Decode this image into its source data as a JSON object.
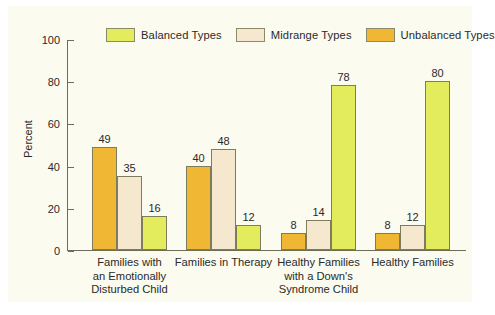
{
  "chart_data": {
    "type": "bar",
    "title": "",
    "xlabel": "",
    "ylabel": "Percent",
    "ylim": [
      0,
      100
    ],
    "yticks": [
      "0",
      "20",
      "40",
      "60",
      "80",
      "100"
    ],
    "grid": false,
    "legend_position": "top",
    "categories": [
      "Families with an Emotionally Disturbed Child",
      "Families in Therapy",
      "Healthy Families with a Down's Syndrome Child",
      "Healthy Families"
    ],
    "category_lines": [
      [
        "Families with",
        "an Emotionally",
        "Disturbed Child"
      ],
      [
        "Families in Therapy"
      ],
      [
        "Healthy Families",
        "with a Down's",
        "Syndrome Child"
      ],
      [
        "Healthy Families"
      ]
    ],
    "series": [
      {
        "name": "Unbalanced Types",
        "color": "#efb733",
        "values": [
          49,
          40,
          8,
          8
        ]
      },
      {
        "name": "Midrange Types",
        "color": "#f5e8cf",
        "values": [
          35,
          48,
          14,
          12
        ]
      },
      {
        "name": "Balanced Types",
        "color": "#e2ec5d",
        "values": [
          16,
          12,
          78,
          80
        ]
      }
    ],
    "legend": [
      {
        "label": "Balanced Types",
        "color": "#e2ec5d"
      },
      {
        "label": "Midrange Types",
        "color": "#f5e8cf"
      },
      {
        "label": "Unbalanced Types",
        "color": "#efb733"
      }
    ]
  }
}
